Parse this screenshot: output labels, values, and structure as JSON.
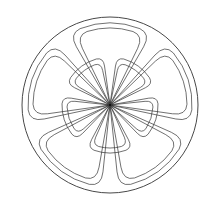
{
  "figure": {
    "type": "line-art crest",
    "center": [
      110,
      105
    ],
    "outer_circle_radius": 88,
    "stroke_color": "#333333",
    "background": "#ffffff",
    "outer_petals": {
      "count": 5,
      "start_angle_deg": -90,
      "inner_r": 2,
      "outer_r": 82,
      "half_angle_deg": 30,
      "offset": 5
    },
    "inner_petals": {
      "count": 5,
      "start_angle_deg": -54,
      "inner_r": 2,
      "outer_r": 48,
      "half_angle_deg": 28,
      "offset": 5
    }
  }
}
